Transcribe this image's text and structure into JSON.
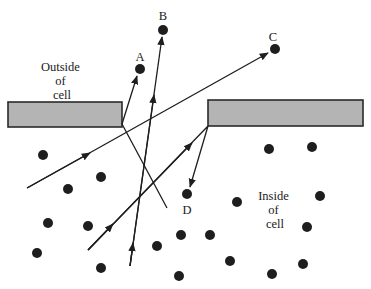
{
  "diagram": {
    "labels": {
      "outside": [
        "Outside",
        "of",
        "cell"
      ],
      "inside": [
        "Inside",
        "of",
        "cell"
      ],
      "points": {
        "A": "A",
        "B": "B",
        "C": "C",
        "D": "D"
      }
    },
    "colors": {
      "membrane_fill": "#b4b4b4",
      "membrane_stroke": "#2a2a2a",
      "molecule": "#1e1e1e",
      "line": "#1e1e1e"
    },
    "membrane_blocks": [
      {
        "name": "left",
        "x": 8,
        "y": 102,
        "w": 114,
        "h": 25
      },
      {
        "name": "right",
        "x": 208,
        "y": 100,
        "w": 155,
        "h": 26
      }
    ],
    "labeled_molecules": [
      {
        "id": "A",
        "x": 140,
        "y": 69,
        "label_x": 140,
        "label_y": 60
      },
      {
        "id": "B",
        "x": 163,
        "y": 30,
        "label_x": 163,
        "label_y": 20
      },
      {
        "id": "C",
        "x": 275,
        "y": 49,
        "label_x": 273,
        "label_y": 40
      },
      {
        "id": "D",
        "x": 187,
        "y": 194,
        "label_x": 187,
        "label_y": 213
      }
    ],
    "inside_molecules": [
      [
        43,
        155
      ],
      [
        101,
        177
      ],
      [
        68,
        189
      ],
      [
        48,
        223
      ],
      [
        88,
        226
      ],
      [
        37,
        253
      ],
      [
        101,
        268
      ],
      [
        237,
        202
      ],
      [
        181,
        235
      ],
      [
        210,
        235
      ],
      [
        157,
        246
      ],
      [
        230,
        261
      ],
      [
        179,
        276
      ],
      [
        269,
        149
      ],
      [
        312,
        147
      ],
      [
        320,
        196
      ],
      [
        307,
        227
      ],
      [
        303,
        264
      ],
      [
        272,
        274
      ]
    ],
    "paths": [
      {
        "name": "path-to-A",
        "points": [
          [
            167,
            208
          ],
          [
            122,
            124
          ],
          [
            137,
            76
          ]
        ],
        "arrow_at": 2
      },
      {
        "name": "path-to-B",
        "points": [
          [
            130,
            266
          ],
          [
            162,
            37
          ]
        ],
        "arrow_mid": [
          [
            133,
            244
          ],
          [
            155,
            88
          ]
        ]
      },
      {
        "name": "path-to-C",
        "points": [
          [
            27,
            188
          ],
          [
            268,
            54
          ]
        ],
        "arrow_mid": [
          [
            90,
            153
          ]
        ]
      },
      {
        "name": "path-to-D",
        "points": [
          [
            88,
            250
          ],
          [
            208,
            126
          ],
          [
            190,
            187
          ]
        ],
        "arrow_mid": [
          [
            113,
            224
          ],
          [
            192,
            145
          ]
        ]
      }
    ]
  }
}
